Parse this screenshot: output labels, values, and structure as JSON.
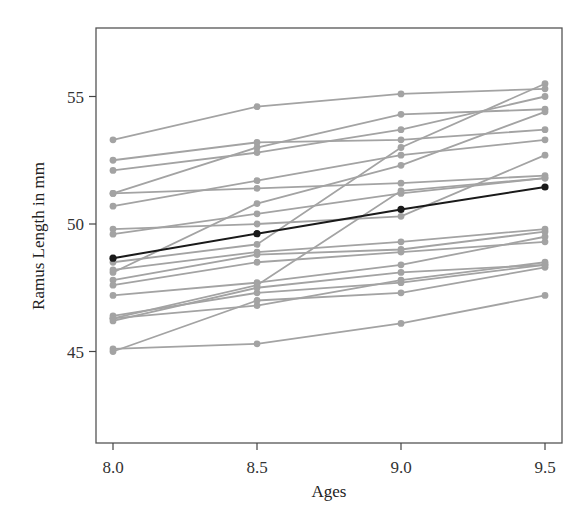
{
  "chart_data": {
    "type": "line",
    "title": "",
    "xlabel": "Ages",
    "ylabel": "Ramus Length in mm",
    "x": [
      8.0,
      8.5,
      9.0,
      9.5
    ],
    "x_tick_labels": [
      "8.0",
      "8.5",
      "9.0",
      "9.5"
    ],
    "y_ticks": [
      45,
      50,
      55
    ],
    "y_tick_labels": [
      "45",
      "50",
      "55"
    ],
    "xlim": [
      7.94,
      9.56
    ],
    "ylim": [
      41.4,
      57.7
    ],
    "grid": false,
    "legend": null,
    "colors": {
      "individual": "#a3a3a3",
      "mean": "#1a1a1a",
      "frame": "#555555"
    },
    "series": [
      {
        "name": "Subject 1",
        "values": [
          47.8,
          48.8,
          49.0,
          49.7
        ]
      },
      {
        "name": "Subject 2",
        "values": [
          46.4,
          47.3,
          47.7,
          48.4
        ]
      },
      {
        "name": "Subject 3",
        "values": [
          46.3,
          46.8,
          47.8,
          48.5
        ]
      },
      {
        "name": "Subject 4",
        "values": [
          45.1,
          45.3,
          46.1,
          47.2
        ]
      },
      {
        "name": "Subject 5",
        "values": [
          47.6,
          48.5,
          48.9,
          49.3
        ]
      },
      {
        "name": "Subject 6",
        "values": [
          52.5,
          53.2,
          53.3,
          53.7
        ]
      },
      {
        "name": "Subject 7",
        "values": [
          51.2,
          53.0,
          54.3,
          54.5
        ]
      },
      {
        "name": "Subject 8",
        "values": [
          49.8,
          50.0,
          50.3,
          52.7
        ]
      },
      {
        "name": "Subject 9",
        "values": [
          48.1,
          50.8,
          52.3,
          54.4
        ]
      },
      {
        "name": "Subject 10",
        "values": [
          45.0,
          47.0,
          47.3,
          48.3
        ]
      },
      {
        "name": "Subject 11",
        "values": [
          51.2,
          51.4,
          51.6,
          51.9
        ]
      },
      {
        "name": "Subject 12",
        "values": [
          48.5,
          49.2,
          53.0,
          55.5
        ]
      },
      {
        "name": "Subject 13",
        "values": [
          52.1,
          52.8,
          53.7,
          55.0
        ]
      },
      {
        "name": "Subject 14",
        "values": [
          48.2,
          48.9,
          49.3,
          49.8
        ]
      },
      {
        "name": "Subject 15",
        "values": [
          49.6,
          50.4,
          51.2,
          51.8
        ]
      },
      {
        "name": "Subject 16",
        "values": [
          50.7,
          51.7,
          52.7,
          53.3
        ]
      },
      {
        "name": "Subject 17",
        "values": [
          47.2,
          47.7,
          48.4,
          49.5
        ]
      },
      {
        "name": "Subject 18",
        "values": [
          53.3,
          54.6,
          55.1,
          55.3
        ]
      },
      {
        "name": "Subject 19",
        "values": [
          46.2,
          47.5,
          48.1,
          48.4
        ]
      },
      {
        "name": "Subject 20",
        "values": [
          46.3,
          47.6,
          51.3,
          51.8
        ]
      }
    ],
    "mean_series": {
      "name": "Mean",
      "values": [
        48.66,
        49.62,
        50.57,
        51.45
      ]
    }
  }
}
